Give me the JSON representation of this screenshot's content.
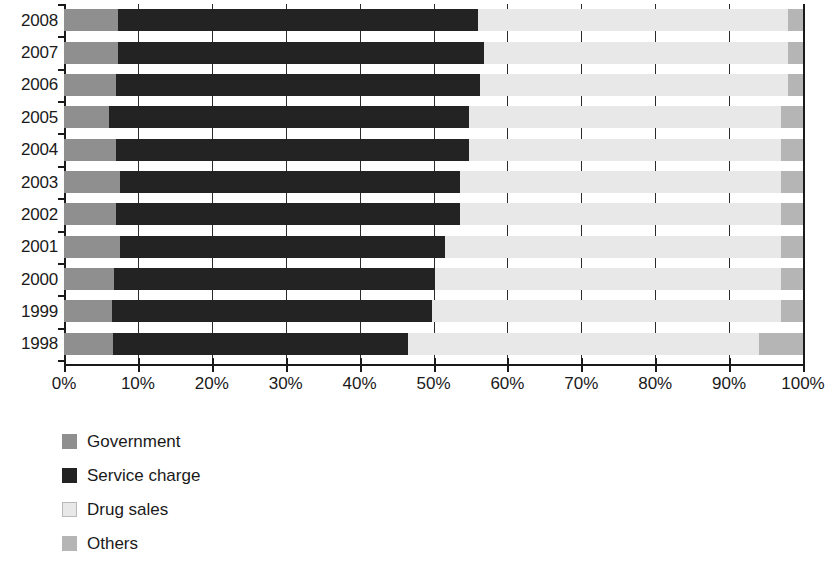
{
  "chart_data": {
    "type": "bar",
    "orientation": "horizontal",
    "stacked": true,
    "stack_mode": "percent",
    "title": "",
    "subtitle": "",
    "xlabel": "",
    "ylabel": "",
    "xlim": [
      0,
      100
    ],
    "xticks": [
      0,
      10,
      20,
      30,
      40,
      50,
      60,
      70,
      80,
      90,
      100
    ],
    "xtick_labels": [
      "0%",
      "10%",
      "20%",
      "30%",
      "40%",
      "50%",
      "60%",
      "70%",
      "80%",
      "90%",
      "100%"
    ],
    "grid": true,
    "grid_axis": "x",
    "legend_position": "bottom-left",
    "categories": [
      "2008",
      "2007",
      "2006",
      "2005",
      "2004",
      "2003",
      "2002",
      "2001",
      "2000",
      "1999",
      "1998"
    ],
    "series": [
      {
        "name": "Government",
        "color": "#8f8f8f",
        "values": [
          7.3,
          7.3,
          7.0,
          6.1,
          7.0,
          7.6,
          7.0,
          7.6,
          6.8,
          6.5,
          6.6
        ]
      },
      {
        "name": "Service charge",
        "color": "#232323",
        "values": [
          48.7,
          49.5,
          49.3,
          48.7,
          47.8,
          46.0,
          46.6,
          43.9,
          43.4,
          43.3,
          39.9
        ]
      },
      {
        "name": "Drug sales",
        "color": "#e8e8e8",
        "values": [
          42.0,
          41.2,
          41.7,
          42.2,
          42.2,
          43.4,
          43.4,
          45.5,
          46.8,
          47.2,
          47.5
        ]
      },
      {
        "name": "Others",
        "color": "#b5b5b5",
        "values": [
          2.0,
          2.0,
          2.0,
          3.0,
          3.0,
          3.0,
          3.0,
          3.0,
          3.0,
          3.0,
          6.0
        ]
      }
    ]
  },
  "axis": {
    "y_labels": [
      "2008",
      "2007",
      "2006",
      "2005",
      "2004",
      "2003",
      "2002",
      "2001",
      "2000",
      "1999",
      "1998"
    ],
    "x_labels": [
      "0%",
      "10%",
      "20%",
      "30%",
      "40%",
      "50%",
      "60%",
      "70%",
      "80%",
      "90%",
      "100%"
    ]
  },
  "legend": {
    "items": [
      {
        "label": "Government",
        "swatch": "government",
        "color": "#8f8f8f"
      },
      {
        "label": "Service charge",
        "swatch": "service",
        "color": "#232323"
      },
      {
        "label": "Drug sales",
        "swatch": "drug",
        "color": "#e8e8e8"
      },
      {
        "label": "Others",
        "swatch": "others",
        "color": "#b5b5b5"
      }
    ]
  }
}
